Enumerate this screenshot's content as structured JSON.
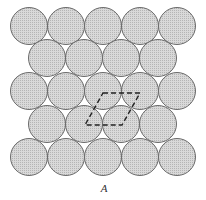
{
  "figure": {
    "label": "A",
    "colors": {
      "circle_fill": "#cfcfcf",
      "circle_stroke": "#6a6a6a",
      "dash_stroke": "#222222",
      "background": "#ffffff"
    },
    "radius": 18.5,
    "rows": [
      {
        "y": 26,
        "xs": [
          29,
          66,
          103,
          140,
          177
        ]
      },
      {
        "y": 58,
        "xs": [
          47,
          84,
          121,
          158
        ]
      },
      {
        "y": 91,
        "xs": [
          29,
          66,
          103,
          140,
          177
        ]
      },
      {
        "y": 124,
        "xs": [
          47,
          84,
          121,
          158
        ]
      },
      {
        "y": 157,
        "xs": [
          29,
          66,
          103,
          140,
          177
        ]
      }
    ],
    "unit_cell": {
      "points": [
        [
          103,
          93
        ],
        [
          140,
          93
        ],
        [
          122,
          125
        ],
        [
          85,
          125
        ]
      ]
    }
  }
}
